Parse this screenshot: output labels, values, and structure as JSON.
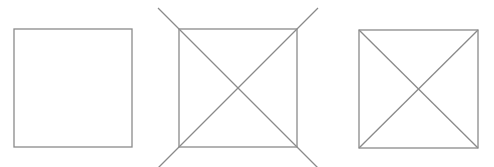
{
  "diagram": {
    "width": 494,
    "height": 167,
    "stroke_color": "#8a8a8a",
    "stroke_width": 1.3,
    "figures": [
      {
        "id": "plain-square",
        "square": {
          "x1": 14,
          "y1": 29,
          "x2": 132,
          "y2": 147
        },
        "lines": []
      },
      {
        "id": "square-with-extended-diagonals",
        "square": {
          "x1": 179,
          "y1": 29,
          "x2": 297,
          "y2": 147
        },
        "lines": [
          {
            "x1": 158,
            "y1": 8,
            "x2": 318,
            "y2": 168
          },
          {
            "x1": 318,
            "y1": 8,
            "x2": 158,
            "y2": 168
          }
        ]
      },
      {
        "id": "square-with-diagonals",
        "square": {
          "x1": 359,
          "y1": 30,
          "x2": 478,
          "y2": 148
        },
        "lines": [
          {
            "x1": 359,
            "y1": 30,
            "x2": 478,
            "y2": 148
          },
          {
            "x1": 478,
            "y1": 30,
            "x2": 359,
            "y2": 148
          }
        ]
      }
    ]
  }
}
